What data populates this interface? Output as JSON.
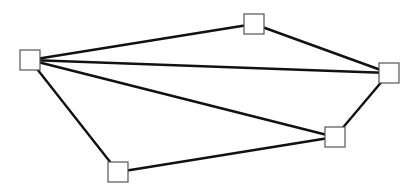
{
  "diagram": {
    "type": "undirected-graph",
    "node_size": 20,
    "colors": {
      "edge": "#111111",
      "node_border": "#555555",
      "node_fill": "#ffffff",
      "background": "#ffffff"
    },
    "nodes": [
      {
        "id": "n1",
        "x": 30,
        "y": 60
      },
      {
        "id": "n2",
        "x": 254,
        "y": 24
      },
      {
        "id": "n3",
        "x": 389,
        "y": 73
      },
      {
        "id": "n4",
        "x": 335,
        "y": 137
      },
      {
        "id": "n5",
        "x": 118,
        "y": 172
      }
    ],
    "edges": [
      {
        "from": "n1",
        "to": "n2"
      },
      {
        "from": "n1",
        "to": "n3"
      },
      {
        "from": "n1",
        "to": "n4"
      },
      {
        "from": "n1",
        "to": "n5"
      },
      {
        "from": "n2",
        "to": "n3"
      },
      {
        "from": "n3",
        "to": "n4"
      },
      {
        "from": "n4",
        "to": "n5"
      }
    ]
  }
}
